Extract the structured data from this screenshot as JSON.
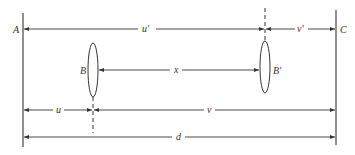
{
  "diagram": {
    "title": "",
    "colors": {
      "line": "#333333",
      "background": "#ffffff"
    },
    "points": {
      "A": "A",
      "C": "C",
      "B": "B",
      "B_prime": "B'"
    },
    "dimensions": {
      "u_prime": "u'",
      "v_prime": "v'",
      "x": "x",
      "u": "u",
      "v": "v",
      "d": "d"
    }
  }
}
